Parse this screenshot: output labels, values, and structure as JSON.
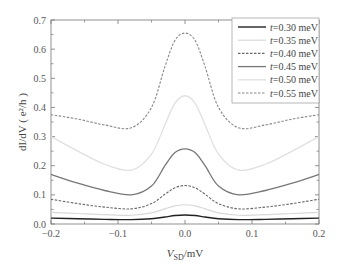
{
  "chart_data": {
    "type": "line",
    "title": "",
    "xlabel": "V_SD/mV",
    "xlabel_main": "V",
    "xlabel_sub": "SD",
    "xlabel_unit": "/mV",
    "ylabel": "dI/dV ( e²/h )",
    "xlim": [
      -0.2,
      0.2
    ],
    "ylim": [
      0.0,
      0.7
    ],
    "xticks": [
      -0.2,
      -0.1,
      0.0,
      0.1,
      0.2
    ],
    "xtick_labels": [
      "−0.2",
      "−0.1",
      "0.0",
      "0.1",
      "0.2"
    ],
    "yticks": [
      0.0,
      0.1,
      0.2,
      0.3,
      0.4,
      0.5,
      0.6,
      0.7
    ],
    "ytick_labels": [
      "0.0",
      "0.1",
      "0.2",
      "0.3",
      "0.4",
      "0.5",
      "0.6",
      "0.7"
    ],
    "grid": false,
    "legend_position": "upper right",
    "x": [
      -0.2,
      -0.16,
      -0.12,
      -0.08,
      -0.05,
      -0.03,
      -0.015,
      0.0,
      0.015,
      0.03,
      0.05,
      0.08,
      0.12,
      0.16,
      0.2
    ],
    "series": [
      {
        "name": "t=0.30 meV",
        "style": "solid",
        "color": "#222222",
        "width": 1.4,
        "values": [
          0.02,
          0.018,
          0.016,
          0.015,
          0.018,
          0.024,
          0.029,
          0.031,
          0.029,
          0.024,
          0.018,
          0.015,
          0.016,
          0.018,
          0.02
        ]
      },
      {
        "name": "t=0.35 meV",
        "style": "solid",
        "color": "#d8d8d8",
        "width": 1.2,
        "values": [
          0.04,
          0.036,
          0.032,
          0.03,
          0.038,
          0.052,
          0.062,
          0.066,
          0.062,
          0.052,
          0.038,
          0.03,
          0.032,
          0.036,
          0.04
        ]
      },
      {
        "name": "t=0.40 meV",
        "style": "dashed",
        "color": "#666666",
        "width": 1.1,
        "values": [
          0.085,
          0.07,
          0.058,
          0.052,
          0.07,
          0.102,
          0.124,
          0.132,
          0.124,
          0.102,
          0.07,
          0.052,
          0.058,
          0.07,
          0.085
        ]
      },
      {
        "name": "t=0.45 meV",
        "style": "solid",
        "color": "#777777",
        "width": 1.3,
        "values": [
          0.17,
          0.14,
          0.115,
          0.1,
          0.13,
          0.2,
          0.245,
          0.258,
          0.245,
          0.2,
          0.13,
          0.1,
          0.115,
          0.14,
          0.17
        ]
      },
      {
        "name": "t=0.50 meV",
        "style": "solid",
        "color": "#e0e0e0",
        "width": 1.3,
        "values": [
          0.3,
          0.25,
          0.205,
          0.185,
          0.24,
          0.34,
          0.415,
          0.44,
          0.415,
          0.34,
          0.24,
          0.185,
          0.205,
          0.25,
          0.3
        ]
      },
      {
        "name": "t=0.55 meV",
        "style": "dashed",
        "color": "#888888",
        "width": 1.1,
        "values": [
          0.375,
          0.36,
          0.34,
          0.33,
          0.4,
          0.54,
          0.63,
          0.655,
          0.63,
          0.54,
          0.4,
          0.33,
          0.34,
          0.36,
          0.375
        ]
      }
    ]
  },
  "legend": {
    "items": [
      {
        "label": "t=0.30 meV",
        "t": "t",
        "rest": "=0.30 meV"
      },
      {
        "label": "t=0.35 meV",
        "t": "t",
        "rest": "=0.35 meV"
      },
      {
        "label": "t=0.40 meV",
        "t": "t",
        "rest": "=0.40 meV"
      },
      {
        "label": "t=0.45 meV",
        "t": "t",
        "rest": "=0.45 meV"
      },
      {
        "label": "t=0.50 meV",
        "t": "t",
        "rest": "=0.50 meV"
      },
      {
        "label": "t=0.55 meV",
        "t": "t",
        "rest": "=0.55 meV"
      }
    ]
  }
}
